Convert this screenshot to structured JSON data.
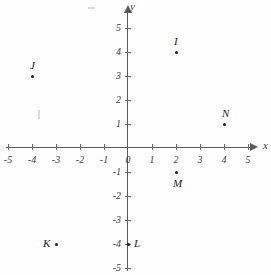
{
  "figure": {
    "kind": "cartesian-coordinate-plane",
    "axes": {
      "x_label": "x",
      "y_label": "y",
      "x_ticks": [
        "-5",
        "-4",
        "-3",
        "-2",
        "-1",
        "0",
        "1",
        "2",
        "3",
        "4",
        "5"
      ],
      "y_ticks_positive": [
        "5",
        "4",
        "3",
        "2",
        "1"
      ],
      "y_ticks_negative": [
        "-1",
        "-2",
        "-3",
        "-4",
        "-5"
      ],
      "x_range": [
        -5,
        5
      ],
      "y_range": [
        -5,
        5
      ],
      "origin_label": "0"
    },
    "points": [
      {
        "label": "I",
        "x": 2,
        "y": 4,
        "label_position": "above"
      },
      {
        "label": "J",
        "x": -4,
        "y": 3,
        "label_position": "above"
      },
      {
        "label": "N",
        "x": 4,
        "y": 1,
        "label_position": "above"
      },
      {
        "label": "M",
        "x": 2,
        "y": -1,
        "label_position": "below"
      },
      {
        "label": "K",
        "x": -3,
        "y": -4,
        "label_position": "left"
      },
      {
        "label": "L",
        "x": 0,
        "y": -4,
        "label_position": "right"
      }
    ],
    "colors": {
      "axis": "#5a5a5a",
      "point": "#1d1d1d",
      "text": "#3a3a3a",
      "background": "#fefefe"
    }
  }
}
